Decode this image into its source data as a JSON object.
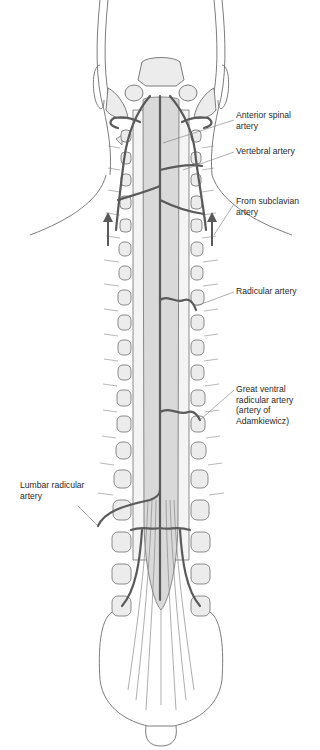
{
  "diagram": {
    "colors": {
      "artery": "#5a5a5a",
      "cord_fill": "#d9d9d9",
      "bone_fill": "#ececec",
      "outline": "#6e6e6e",
      "leader": "#7a7a7a",
      "text": "#2a2a2a"
    },
    "labels": [
      {
        "id": "anterior-spinal-artery",
        "lines": [
          "Anterior spinal",
          "artery"
        ],
        "x": 236,
        "y": 116
      },
      {
        "id": "vertebral-artery",
        "lines": [
          "Vertebral artery"
        ],
        "x": 236,
        "y": 148
      },
      {
        "id": "from-subclavian-artery",
        "lines": [
          "From subclavian",
          "artery"
        ],
        "x": 236,
        "y": 200
      },
      {
        "id": "radicular-artery",
        "lines": [
          "Radicular artery"
        ],
        "x": 236,
        "y": 288
      },
      {
        "id": "great-ventral-radicular-artery",
        "lines": [
          "Great ventral",
          "radicular artery",
          "(artery of",
          "Adamkiewicz)"
        ],
        "x": 236,
        "y": 386
      },
      {
        "id": "lumbar-radicular-artery",
        "lines": [
          "Lumbar radicular",
          "artery"
        ],
        "x": 20,
        "y": 482
      }
    ]
  }
}
